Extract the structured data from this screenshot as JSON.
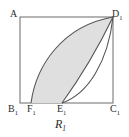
{
  "figure": {
    "caption_text": "R",
    "caption_subscript": "1",
    "background_color": "#ffffff",
    "stroke_color": "#5a5a5a",
    "shaded_fill_color": "#dfdfdf"
  },
  "vertices": [
    {
      "id": "A",
      "base": "A",
      "subscript": "",
      "x": 20,
      "y": 17,
      "label_x": 10,
      "label_y": 9
    },
    {
      "id": "D1",
      "base": "D",
      "subscript": "1",
      "x": 113,
      "y": 17,
      "label_x": 112,
      "label_y": 9
    },
    {
      "id": "B1",
      "base": "B",
      "subscript": "1",
      "x": 20,
      "y": 103,
      "label_x": 8,
      "label_y": 104
    },
    {
      "id": "F1",
      "base": "F",
      "subscript": "1",
      "x": 31,
      "y": 103,
      "label_x": 27,
      "label_y": 104
    },
    {
      "id": "E1",
      "base": "E",
      "subscript": "1",
      "x": 62,
      "y": 103,
      "label_x": 57,
      "label_y": 104
    },
    {
      "id": "C1",
      "base": "C",
      "subscript": "1",
      "x": 113,
      "y": 103,
      "label_x": 110,
      "label_y": 104
    }
  ],
  "geometry": {
    "rectangle": {
      "left": 20,
      "top": 17,
      "right": 113,
      "bottom": 103
    },
    "curves": [
      {
        "name": "upper-arc-F1-to-D1",
        "from": "F1",
        "to": "D1",
        "path": "M 31 103 C 36 66 62 26 113 17"
      },
      {
        "name": "inner-curve-E1-to-D1",
        "from": "E1",
        "to": "D1",
        "path": "M 62 103 C 80 78 100 44 113 17"
      },
      {
        "name": "outer-curve-E1-to-D1",
        "from": "E1",
        "to": "D1",
        "path": "M 62 103 C 88 94 108 62 113 17"
      }
    ],
    "shaded_region_path": "M 31 103 C 36 66 62 26 113 17 C 100 44 80 78 62 103 Z"
  }
}
